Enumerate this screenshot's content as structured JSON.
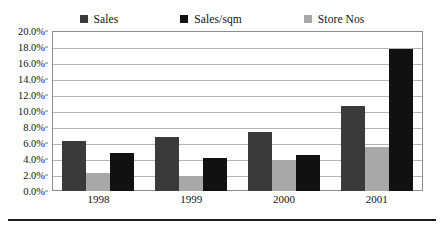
{
  "chart_data": {
    "type": "bar",
    "title": "",
    "subtitle": "",
    "xlabel": "",
    "ylabel": "",
    "categories": [
      "1998",
      "1999",
      "2000",
      "2001"
    ],
    "series": [
      {
        "name": "Sales",
        "color": "#3a3a3a",
        "values": [
          6.3,
          6.7,
          7.4,
          10.6
        ]
      },
      {
        "name": "Store Nos",
        "color": "#a8a8a8",
        "values": [
          2.2,
          1.9,
          3.9,
          5.5
        ]
      },
      {
        "name": "Sales/sqm",
        "color": "#111111",
        "values": [
          4.7,
          4.1,
          4.5,
          17.7
        ]
      }
    ],
    "legend_order": [
      "Sales",
      "Sales/sqm",
      "Store Nos"
    ],
    "bar_order": [
      "Sales",
      "Store Nos",
      "Sales/sqm"
    ],
    "ylim": [
      0,
      20
    ],
    "ytick_step": 2,
    "ytick_labels": [
      "20.0%",
      "18.0%",
      "16.0%",
      "14.0%",
      "12.0%",
      "10.0%",
      "8.0%",
      "6.0%",
      "4.0%",
      "2.0%",
      "0.0%"
    ],
    "ytick_values": [
      20,
      18,
      16,
      14,
      12,
      10,
      8,
      6,
      4,
      2,
      0
    ],
    "grid": true,
    "legend_position": "top"
  },
  "legend": {
    "entries": [
      {
        "label": "Sales",
        "color": "#3a3a3a"
      },
      {
        "label": "Sales/sqm",
        "color": "#111111"
      },
      {
        "label": "Store Nos",
        "color": "#a8a8a8"
      }
    ]
  }
}
